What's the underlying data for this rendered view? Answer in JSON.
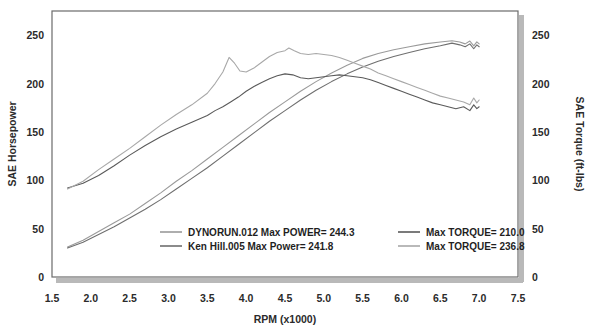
{
  "chart_data": {
    "type": "line",
    "title": "",
    "xlabel": "RPM (x1000)",
    "ylabel": "SAE Horsepower",
    "y2label": "SAE Torque (ft-lbs)",
    "xlim": [
      1.5,
      7.5
    ],
    "ylim": [
      0,
      275
    ],
    "y2lim": [
      0,
      275
    ],
    "xticks": [
      "1.5",
      "2.0",
      "2.5",
      "3.0",
      "3.5",
      "4.0",
      "4.5",
      "5.0",
      "5.5",
      "6.0",
      "6.5",
      "7.0",
      "7.5"
    ],
    "xtick_values": [
      1.5,
      2.0,
      2.5,
      3.0,
      3.5,
      4.0,
      4.5,
      5.0,
      5.5,
      6.0,
      6.5,
      7.0,
      7.5
    ],
    "yticks": [
      "0",
      "50",
      "100",
      "150",
      "200",
      "250"
    ],
    "ytick_values": [
      0,
      50,
      100,
      150,
      200,
      250
    ],
    "y2ticks": [
      "0",
      "50",
      "100",
      "150",
      "200",
      "250"
    ],
    "y2tick_values": [
      0,
      50,
      100,
      150,
      200,
      250
    ],
    "grid": false,
    "legend_position": "inside-bottom",
    "series": [
      {
        "name": "DYNORUN.012 Max POWER= 244.3",
        "axis": "left",
        "color": "#9a9a9a",
        "x": [
          1.7,
          1.9,
          2.1,
          2.3,
          2.5,
          2.7,
          2.9,
          3.1,
          3.3,
          3.5,
          3.7,
          3.9,
          4.1,
          4.3,
          4.5,
          4.7,
          4.9,
          5.1,
          5.3,
          5.5,
          5.7,
          5.9,
          6.1,
          6.3,
          6.5,
          6.65,
          6.75,
          6.82,
          6.88,
          6.93,
          6.97,
          7.0
        ],
        "y": [
          31,
          38,
          47,
          56,
          65,
          76,
          87,
          99,
          110,
          122,
          134,
          146,
          158,
          170,
          181,
          192,
          202,
          211,
          219,
          226,
          231,
          235,
          238,
          241,
          243,
          244.3,
          243,
          241,
          244,
          239,
          243,
          241
        ]
      },
      {
        "name": "Ken Hill.005 Max Power= 241.8",
        "axis": "left",
        "color": "#6f6f6f",
        "x": [
          1.7,
          1.9,
          2.1,
          2.3,
          2.5,
          2.7,
          2.9,
          3.1,
          3.3,
          3.5,
          3.7,
          3.9,
          4.1,
          4.3,
          4.5,
          4.7,
          4.9,
          5.1,
          5.3,
          5.5,
          5.7,
          5.9,
          6.1,
          6.3,
          6.5,
          6.65,
          6.75,
          6.82,
          6.88,
          6.93,
          6.97,
          7.0
        ],
        "y": [
          30,
          36,
          44,
          52,
          61,
          70,
          80,
          91,
          102,
          113,
          125,
          137,
          149,
          161,
          172,
          183,
          193,
          202,
          210,
          217,
          223,
          228,
          232,
          236,
          239,
          241.8,
          240,
          238,
          241,
          236,
          240,
          238
        ]
      },
      {
        "name": "Max TORQUE= 210.0",
        "axis": "right",
        "color": "#5a5a5a",
        "x": [
          1.7,
          1.9,
          2.1,
          2.3,
          2.5,
          2.7,
          2.9,
          3.1,
          3.3,
          3.5,
          3.6,
          3.7,
          3.8,
          3.9,
          4.0,
          4.1,
          4.2,
          4.3,
          4.4,
          4.5,
          4.6,
          4.7,
          4.8,
          4.9,
          5.0,
          5.1,
          5.2,
          5.3,
          5.4,
          5.5,
          5.6,
          5.7,
          5.8,
          5.9,
          6.0,
          6.1,
          6.2,
          6.3,
          6.4,
          6.5,
          6.6,
          6.7,
          6.8,
          6.88,
          6.93,
          6.97,
          7.0
        ],
        "y": [
          92,
          97,
          105,
          115,
          126,
          136,
          145,
          153,
          160,
          167,
          172,
          176,
          181,
          186,
          192,
          197,
          201,
          205,
          208,
          210,
          209,
          206,
          205,
          206,
          207,
          208,
          209,
          208,
          207,
          206,
          204,
          201,
          198,
          195,
          192,
          189,
          186,
          183,
          180,
          178,
          176,
          174,
          176,
          172,
          178,
          174,
          176
        ]
      },
      {
        "name": "Max TORQUE= 236.8",
        "axis": "right",
        "color": "#a8a8a8",
        "x": [
          1.7,
          1.9,
          2.1,
          2.3,
          2.5,
          2.7,
          2.9,
          3.1,
          3.3,
          3.5,
          3.6,
          3.7,
          3.78,
          3.85,
          3.92,
          4.0,
          4.1,
          4.2,
          4.3,
          4.4,
          4.5,
          4.55,
          4.62,
          4.7,
          4.8,
          4.9,
          5.0,
          5.1,
          5.2,
          5.3,
          5.4,
          5.5,
          5.6,
          5.7,
          5.8,
          5.9,
          6.0,
          6.1,
          6.2,
          6.3,
          6.4,
          6.5,
          6.6,
          6.7,
          6.8,
          6.88,
          6.93,
          6.97,
          7.0
        ],
        "y": [
          91,
          99,
          111,
          122,
          133,
          145,
          157,
          168,
          178,
          190,
          200,
          212,
          227,
          221,
          213,
          212,
          216,
          222,
          228,
          232,
          234,
          236.8,
          234,
          231,
          230,
          231,
          230,
          229,
          227,
          224,
          221,
          218,
          215,
          211,
          208,
          205,
          202,
          199,
          196,
          193,
          190,
          187,
          185,
          183,
          181,
          178,
          185,
          180,
          183
        ]
      }
    ],
    "legend": [
      {
        "label": "DYNORUN.012  Max POWER= 244.3",
        "color": "#9a9a9a",
        "column": "left"
      },
      {
        "label": "Ken Hill.005  Max Power= 241.8",
        "color": "#6f6f6f",
        "column": "left"
      },
      {
        "label": "Max TORQUE= 210.0",
        "color": "#5a5a5a",
        "column": "right"
      },
      {
        "label": "Max TORQUE= 236.8",
        "color": "#a8a8a8",
        "column": "right"
      }
    ]
  }
}
